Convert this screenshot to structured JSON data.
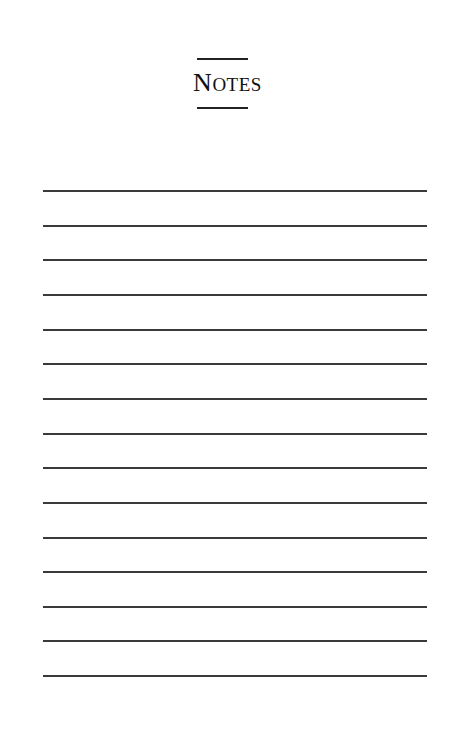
{
  "page": {
    "title_initial": "N",
    "title_rest": "OTES",
    "title_full": "Notes",
    "ruled_line_count": 15,
    "ruled_line_top": 190,
    "ruled_line_spacing": 34.65
  }
}
